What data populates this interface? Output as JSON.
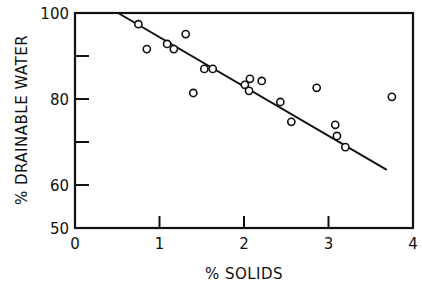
{
  "chart_data": {
    "type": "scatter",
    "title": "",
    "xlabel": "% SOLIDS",
    "ylabel": "% DRAINABLE WATER",
    "xlim": [
      0,
      4
    ],
    "ylim": [
      50,
      100
    ],
    "x_ticks": [
      "0",
      "1",
      "2",
      "3",
      "4"
    ],
    "y_ticks": [
      "50",
      "60",
      "80",
      "100"
    ],
    "y_minor_ticks": [
      70,
      90
    ],
    "grid": false,
    "legend": null,
    "series": [
      {
        "name": "observations",
        "marker": "open-circle",
        "points": [
          {
            "x": 0.75,
            "y": 97.4
          },
          {
            "x": 0.85,
            "y": 91.6
          },
          {
            "x": 1.09,
            "y": 92.8
          },
          {
            "x": 1.17,
            "y": 91.6
          },
          {
            "x": 1.31,
            "y": 95.1
          },
          {
            "x": 1.4,
            "y": 81.4
          },
          {
            "x": 1.53,
            "y": 87.0
          },
          {
            "x": 1.63,
            "y": 87.0
          },
          {
            "x": 2.01,
            "y": 83.3
          },
          {
            "x": 2.07,
            "y": 84.7
          },
          {
            "x": 2.06,
            "y": 81.9
          },
          {
            "x": 2.21,
            "y": 84.2
          },
          {
            "x": 2.43,
            "y": 79.3
          },
          {
            "x": 2.56,
            "y": 74.7
          },
          {
            "x": 2.86,
            "y": 82.6
          },
          {
            "x": 3.08,
            "y": 74.0
          },
          {
            "x": 3.1,
            "y": 71.4
          },
          {
            "x": 3.2,
            "y": 68.8
          },
          {
            "x": 3.75,
            "y": 80.5
          }
        ]
      },
      {
        "name": "fit-line",
        "type": "line",
        "points": [
          {
            "x": 0.51,
            "y": 100
          },
          {
            "x": 3.69,
            "y": 63.5
          }
        ]
      }
    ]
  }
}
